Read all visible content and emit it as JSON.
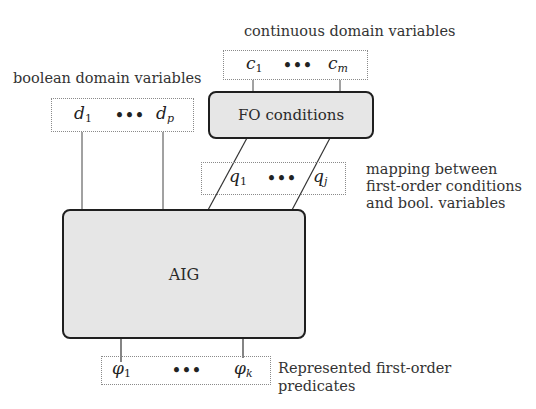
{
  "labels": {
    "continuous": "continuous domain variables",
    "boolean": "boolean domain variables",
    "mapping_line1": "mapping between",
    "mapping_line2": "first-order conditions",
    "mapping_line3": "and bool. variables",
    "represented_line1": "Represented first-order",
    "represented_line2": "predicates"
  },
  "boxes": {
    "fo": "FO conditions",
    "aig": "AIG"
  },
  "variables": {
    "c": {
      "base": "c",
      "first_sub": "1",
      "last_sub": "m"
    },
    "d": {
      "base": "d",
      "first_sub": "1",
      "last_sub": "p"
    },
    "q": {
      "base": "q",
      "first_sub": "1",
      "last_sub": "j"
    },
    "phi": {
      "base": "φ",
      "first_sub": "1",
      "last_sub": "k"
    },
    "ellipsis": "•••"
  }
}
